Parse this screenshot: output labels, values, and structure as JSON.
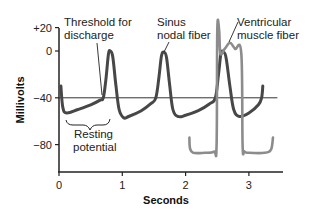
{
  "chart_data": {
    "type": "line",
    "title": "",
    "xlabel": "Seconds",
    "ylabel": "Millivolts",
    "xlim": [
      0,
      3.5
    ],
    "ylim": [
      -100,
      20
    ],
    "x_ticks": [
      0,
      1,
      2,
      3
    ],
    "x_tick_labels": [
      "0",
      "1",
      "2",
      "3"
    ],
    "y_ticks": [
      20,
      0,
      -40,
      -80
    ],
    "y_tick_labels": [
      "+20",
      "0",
      "−40",
      "−80"
    ],
    "grid": false,
    "reference_line": {
      "y": -40,
      "x_range": [
        0,
        3.45
      ]
    },
    "series": [
      {
        "name": "Sinus nodal fiber",
        "color": "#474747",
        "points": [
          [
            0.03,
            -30
          ],
          [
            0.06,
            -48
          ],
          [
            0.12,
            -53
          ],
          [
            0.3,
            -50
          ],
          [
            0.5,
            -46
          ],
          [
            0.65,
            -42
          ],
          [
            0.7,
            -40
          ],
          [
            0.74,
            -25
          ],
          [
            0.78,
            -3
          ],
          [
            0.81,
            0
          ],
          [
            0.85,
            -5
          ],
          [
            0.9,
            -30
          ],
          [
            0.95,
            -50
          ],
          [
            1.02,
            -57
          ],
          [
            1.1,
            -56
          ],
          [
            1.3,
            -51
          ],
          [
            1.45,
            -45
          ],
          [
            1.53,
            -40
          ],
          [
            1.58,
            -22
          ],
          [
            1.62,
            -4
          ],
          [
            1.66,
            -1
          ],
          [
            1.7,
            -6
          ],
          [
            1.75,
            -30
          ],
          [
            1.8,
            -50
          ],
          [
            1.88,
            -56
          ],
          [
            2.0,
            -55
          ],
          [
            2.2,
            -51
          ],
          [
            2.38,
            -45
          ],
          [
            2.47,
            -40
          ],
          [
            2.52,
            -20
          ],
          [
            2.56,
            -2
          ],
          [
            2.6,
            -1
          ],
          [
            2.64,
            -6
          ],
          [
            2.7,
            -30
          ],
          [
            2.76,
            -50
          ],
          [
            2.85,
            -56
          ],
          [
            3.0,
            -53
          ],
          [
            3.15,
            -46
          ],
          [
            3.2,
            -40
          ],
          [
            3.22,
            -30
          ]
        ]
      },
      {
        "name": "Ventricular muscle fiber",
        "color": "#8c8c8c",
        "points": [
          [
            2.06,
            -74
          ],
          [
            2.07,
            -83
          ],
          [
            2.12,
            -87
          ],
          [
            2.3,
            -87
          ],
          [
            2.45,
            -86
          ],
          [
            2.49,
            -80
          ],
          [
            2.5,
            18
          ],
          [
            2.53,
            18
          ],
          [
            2.55,
            -2
          ],
          [
            2.62,
            2
          ],
          [
            2.7,
            7
          ],
          [
            2.78,
            2
          ],
          [
            2.88,
            -2
          ],
          [
            2.9,
            -80
          ],
          [
            2.93,
            -86
          ],
          [
            3.0,
            -87
          ],
          [
            3.25,
            -87
          ],
          [
            3.35,
            -84
          ],
          [
            3.38,
            -74
          ]
        ]
      }
    ],
    "annotations": [
      {
        "id": "threshold",
        "lines": [
          "Threshold for",
          "discharge"
        ]
      },
      {
        "id": "sinus",
        "lines": [
          "Sinus",
          "nodal fiber"
        ]
      },
      {
        "id": "ventricular",
        "lines": [
          "Ventricular",
          "muscle fiber"
        ]
      },
      {
        "id": "resting",
        "lines": [
          "Resting",
          "potential"
        ]
      }
    ]
  }
}
